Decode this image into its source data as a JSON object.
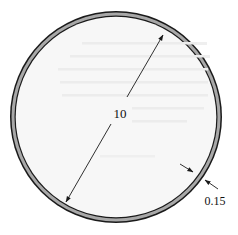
{
  "diagram": {
    "shape": "circle",
    "dimensions": {
      "diameter": {
        "label": "10",
        "kind": "diameter-arrow"
      },
      "wall_thickness": {
        "label": "0.15",
        "kind": "thickness-arrows"
      }
    },
    "colors": {
      "outline": "#1a1a1a",
      "wall_fill": "#a8a8a8",
      "interior": "#f7f7f7",
      "background": "#ffffff",
      "text": "#111111"
    }
  }
}
